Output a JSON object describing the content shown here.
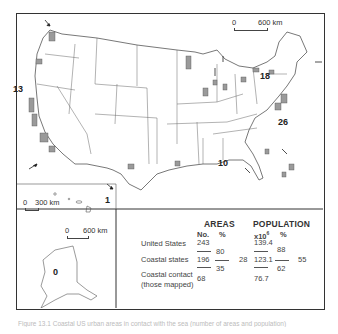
{
  "figure": {
    "caption": "Figure 13.1  Coastal US urban areas in contact with the sea (number of areas and population)"
  },
  "map": {
    "region_labels": [
      {
        "id": "west-coast",
        "value": "13"
      },
      {
        "id": "great-lakes",
        "value": "18"
      },
      {
        "id": "east-coast",
        "value": "26"
      },
      {
        "id": "gulf-coast",
        "value": "10"
      },
      {
        "id": "hawaii",
        "value": "1"
      },
      {
        "id": "alaska",
        "value": "0"
      }
    ],
    "scale_main": {
      "start": "0",
      "end": "600 km"
    },
    "scale_hawaii": {
      "start": "0",
      "end": "300 km"
    },
    "scale_alaska": {
      "start": "0",
      "end": "600 km"
    },
    "colors": {
      "coastal_areas": "#9a9a9a",
      "borders": "#555555",
      "frame": "#333333"
    }
  },
  "table": {
    "areas_header": "AREAS",
    "population_header": "POPULATION",
    "col_no": "No.",
    "col_pct": "%",
    "col_pop": "x10",
    "col_pop_exp": "6",
    "col_pop_pct": "%",
    "rows": [
      {
        "label": "United States",
        "areas_no": "243",
        "pop": "139.4"
      },
      {
        "label": "Coastal states",
        "areas_no": "196",
        "pop": "123.1"
      },
      {
        "label_line1": "Coastal contact",
        "label_line2": "(those mapped)",
        "areas_no": "68",
        "pop": "76.7"
      }
    ],
    "ratios": {
      "areas_states_over_us": "80",
      "areas_contact_over_states": "35",
      "areas_contact_over_us": "28",
      "pop_states_over_us": "88",
      "pop_contact_over_states": "62",
      "pop_contact_over_us": "55"
    }
  }
}
